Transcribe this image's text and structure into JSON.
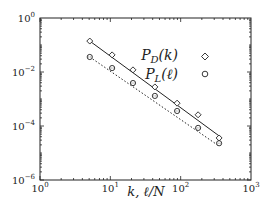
{
  "chart_data": {
    "type": "scatter",
    "title": "",
    "xlabel": "k, ℓ/N",
    "ylabel": "",
    "xscale": "log",
    "yscale": "log",
    "xlim": [
      1,
      1000
    ],
    "ylim": [
      1e-06,
      1
    ],
    "grid": false,
    "legend_position": "upper right",
    "x_ticks": [
      {
        "base": "10",
        "exp": "0",
        "value": 1
      },
      {
        "base": "10",
        "exp": "1",
        "value": 10
      },
      {
        "base": "10",
        "exp": "2",
        "value": 100
      },
      {
        "base": "10",
        "exp": "3",
        "value": 1000
      }
    ],
    "y_ticks": [
      {
        "base": "10",
        "exp": "0",
        "value": 1
      },
      {
        "base": "10",
        "exp": "−2",
        "value": 0.01
      },
      {
        "base": "10",
        "exp": "−4",
        "value": 0.0001
      },
      {
        "base": "10",
        "exp": "−6",
        "value": 1e-06
      }
    ],
    "series": [
      {
        "name": "P_D(k)",
        "label_main": "P",
        "label_sub": "D",
        "label_arg": "(k)",
        "marker": "diamond",
        "line_style": "solid",
        "color": "#222222",
        "x": [
          5.1,
          10.6,
          21,
          43,
          89,
          177,
          352
        ],
        "y": [
          0.14,
          0.043,
          0.012,
          0.0028,
          0.0007,
          0.00026,
          3.6e-05
        ],
        "fit_line": {
          "x": [
            5.1,
            352
          ],
          "y": [
            0.14,
            4.3e-05
          ]
        }
      },
      {
        "name": "P_L(ℓ)",
        "label_main": "P",
        "label_sub": "L",
        "label_arg": "(ℓ)",
        "marker": "circle",
        "line_style": "dotted",
        "color": "#222222",
        "x": [
          5.1,
          10.6,
          21,
          43,
          89,
          177,
          352
        ],
        "y": [
          0.036,
          0.014,
          0.0039,
          0.0013,
          0.00036,
          8.5e-05,
          2.3e-05
        ],
        "fit_line": {
          "x": [
            5.1,
            352
          ],
          "y": [
            0.036,
            1.8e-05
          ]
        }
      }
    ]
  }
}
